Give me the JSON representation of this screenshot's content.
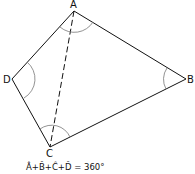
{
  "diagram": {
    "type": "quadrilateral",
    "vertices": [
      {
        "label": "A",
        "x": 74,
        "y": 11
      },
      {
        "label": "B",
        "x": 186,
        "y": 79
      },
      {
        "label": "C",
        "x": 50,
        "y": 147
      },
      {
        "label": "D",
        "x": 12,
        "y": 79
      }
    ],
    "diagonal": {
      "from": "A",
      "to": "C",
      "style": "dashed"
    },
    "angle_arcs": [
      "A",
      "B",
      "C",
      "D"
    ],
    "formula": "Â + B̂ + Ĉ + D̂ = 360°"
  },
  "labels": {
    "A": "A",
    "B": "B",
    "C": "C",
    "D": "D",
    "formula": "Â+B̂+Ĉ+D̂ = 360°"
  },
  "colors": {
    "line": "#111111",
    "arc": "#777777"
  }
}
